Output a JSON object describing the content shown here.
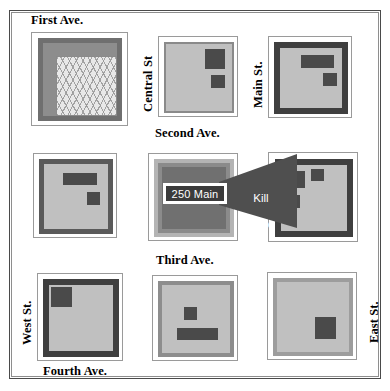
{
  "document": {
    "kind": "tactical-block-map",
    "title_visible": false
  },
  "streets": {
    "first_ave": "First Ave.",
    "second_ave": "Second Ave.",
    "third_ave": "Third Ave.",
    "fourth_ave": "Fourth Ave.",
    "central_st": "Central St",
    "main_st": "Main St.",
    "west_st": "West St.",
    "east_st": "East St."
  },
  "callout": {
    "address_label": "250 Main",
    "zone_label": "Kill\nZone",
    "zone_label_line1": "Kill",
    "zone_label_line2": "Zone"
  },
  "colors": {
    "page_background": "#ffffff",
    "page_border": "#4a4a4a",
    "block_outline": "#9a9a9a",
    "block_frame": "#6f6f6f",
    "block_interior": "#c6c6c6",
    "building_dark": "#4a4a4a",
    "building_mid": "#707070",
    "hatch_fill": "#e8e8e8",
    "callout_wedge": "#4f4f4f",
    "callout_label_fill": "#3b3b3b",
    "callout_label_border": "#ffffff",
    "callout_text": "#ffffff"
  },
  "blocks": [
    {
      "id": "block-r1c1",
      "name": "block-first-ave-central-st",
      "row": 1,
      "column": 1,
      "interior_style": "hatched",
      "buildings": 0
    },
    {
      "id": "block-r1c2",
      "name": "block-first-ave-second-ave",
      "row": 1,
      "column": 2,
      "interior_style": "plain",
      "buildings": 2
    },
    {
      "id": "block-r1c3",
      "name": "block-first-ave-main-st",
      "row": 1,
      "column": 3,
      "interior_style": "plain",
      "buildings": 2
    },
    {
      "id": "block-r2c1",
      "name": "block-second-ave-west-st",
      "row": 2,
      "column": 1,
      "interior_style": "plain",
      "buildings": 2
    },
    {
      "id": "block-r2c2",
      "name": "block-250-main-target",
      "row": 2,
      "column": 2,
      "interior_style": "plain",
      "buildings": 0,
      "label": "250 Main"
    },
    {
      "id": "block-r2c3",
      "name": "block-kill-zone",
      "row": 2,
      "column": 3,
      "interior_style": "plain",
      "buildings": 3,
      "label": "Kill Zone"
    },
    {
      "id": "block-r3c1",
      "name": "block-fourth-ave-west-st",
      "row": 3,
      "column": 1,
      "interior_style": "plain",
      "buildings": 1
    },
    {
      "id": "block-r3c2",
      "name": "block-fourth-ave-center",
      "row": 3,
      "column": 2,
      "interior_style": "plain",
      "buildings": 2
    },
    {
      "id": "block-r3c3",
      "name": "block-fourth-ave-east-st",
      "row": 3,
      "column": 3,
      "interior_style": "plain",
      "buildings": 1
    }
  ]
}
